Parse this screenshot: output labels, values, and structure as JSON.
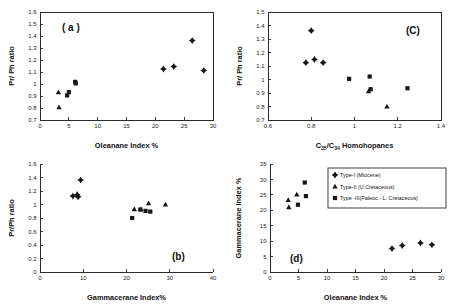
{
  "figure": {
    "background": "#ffffff",
    "marker_color": "#17171a",
    "axis_color": "#2b2b2b"
  },
  "legend": {
    "title": "",
    "entries": [
      {
        "marker": "diamond",
        "label": "Type-I (Miocene)"
      },
      {
        "marker": "triangle",
        "label": "Type-II (U.Cretaceous)"
      },
      {
        "marker": "square",
        "label": "Type -III(Paleoc.- L. Cretaceous)"
      }
    ]
  },
  "chart_data": [
    {
      "id": "panel-a",
      "type": "scatter",
      "title": "( a )",
      "xlabel": "Oleanane Index %",
      "ylabel": "Pr/ Ph ratio",
      "xlim": [
        0,
        30
      ],
      "ylim": [
        0.7,
        1.6
      ],
      "xticks": [
        0,
        5,
        10,
        15,
        20,
        25,
        30
      ],
      "yticks": [
        0.7,
        0.8,
        0.9,
        1.0,
        1.1,
        1.2,
        1.3,
        1.4,
        1.5,
        1.6
      ],
      "ytick_labels": [
        "0.7",
        "0.8",
        "0.9",
        "1",
        "1.1",
        "1.2",
        "1.3",
        "1.4",
        "1.5",
        "1.6"
      ],
      "grid": false,
      "series": [
        {
          "name": "Type-I (Miocene)",
          "marker": "diamond",
          "points": [
            [
              21.4,
              1.125
            ],
            [
              23.2,
              1.145
            ],
            [
              26.4,
              1.362
            ],
            [
              28.4,
              1.113
            ]
          ]
        },
        {
          "name": "Type-II (U.Cretaceous)",
          "marker": "triangle",
          "points": [
            [
              3.2,
              0.93
            ],
            [
              3.3,
              0.805
            ]
          ]
        },
        {
          "name": "Type -III(Paleoc.- L. Cretaceous)",
          "marker": "square",
          "points": [
            [
              4.7,
              0.905
            ],
            [
              5.0,
              0.932
            ],
            [
              6.1,
              1.018
            ],
            [
              6.2,
              1.005
            ]
          ]
        }
      ]
    },
    {
      "id": "panel-c",
      "type": "scatter",
      "title": "(C)",
      "xlabel": "C35/C34 Homohopanes",
      "xlabel_parts": [
        {
          "text": "C",
          "sub": false
        },
        {
          "text": "35",
          "sub": true
        },
        {
          "text": "/C",
          "sub": false
        },
        {
          "text": "34",
          "sub": true
        },
        {
          "text": " Homohopanes",
          "sub": false
        }
      ],
      "ylabel": "Pr/ Ph ratio",
      "xlim": [
        0.6,
        1.4
      ],
      "ylim": [
        0.7,
        1.5
      ],
      "xticks": [
        0.6,
        0.8,
        1.0,
        1.2,
        1.4
      ],
      "xtick_labels": [
        "0.6",
        "0.8",
        "1",
        "1.2",
        "1.4"
      ],
      "yticks": [
        0.7,
        0.8,
        0.9,
        1.0,
        1.1,
        1.2,
        1.3,
        1.4,
        1.5
      ],
      "ytick_labels": [
        "0.7",
        "0.8",
        "0.9",
        "1",
        "1.1",
        "1.2",
        "1.3",
        "1.4",
        "1.5"
      ],
      "grid": false,
      "series": [
        {
          "name": "Type-I (Miocene)",
          "marker": "diamond",
          "points": [
            [
              0.775,
              1.125
            ],
            [
              0.8,
              1.362
            ],
            [
              0.815,
              1.148
            ],
            [
              0.855,
              1.125
            ]
          ]
        },
        {
          "name": "Type-II (U.Cretaceous)",
          "marker": "triangle",
          "points": [
            [
              1.065,
              0.912
            ],
            [
              1.15,
              0.8
            ]
          ]
        },
        {
          "name": "Type -III(Paleoc.- L. Cretaceous)",
          "marker": "square",
          "points": [
            [
              0.975,
              1.005
            ],
            [
              1.07,
              1.022
            ],
            [
              1.075,
              0.928
            ],
            [
              1.245,
              0.935
            ]
          ]
        }
      ]
    },
    {
      "id": "panel-b",
      "type": "scatter",
      "title": "(b)",
      "xlabel": "Gammacerane Index%",
      "ylabel": "Pr/Ph ratio",
      "xlim": [
        0,
        40
      ],
      "ylim": [
        0,
        1.6
      ],
      "xticks": [
        0,
        10,
        20,
        30,
        40
      ],
      "yticks": [
        0,
        0.2,
        0.4,
        0.6,
        0.8,
        1.0,
        1.2,
        1.4,
        1.6
      ],
      "ytick_labels": [
        "0",
        "0.2",
        "0.4",
        "0.6",
        "0.8",
        "1",
        "1.2",
        "1.4",
        "1.6"
      ],
      "grid": false,
      "series": [
        {
          "name": "Type-I (Miocene)",
          "marker": "diamond",
          "points": [
            [
              7.6,
              1.125
            ],
            [
              8.6,
              1.145
            ],
            [
              8.8,
              1.113
            ],
            [
              9.4,
              1.362
            ]
          ]
        },
        {
          "name": "Type-II (U.Cretaceous)",
          "marker": "triangle",
          "points": [
            [
              21.8,
              0.93
            ],
            [
              23.3,
              0.928
            ],
            [
              25.1,
              1.018
            ],
            [
              29.0,
              1.0
            ]
          ]
        },
        {
          "name": "Type -III(Paleoc.- L. Cretaceous)",
          "marker": "square",
          "points": [
            [
              21.3,
              0.8
            ],
            [
              23.2,
              0.925
            ],
            [
              24.4,
              0.905
            ],
            [
              25.5,
              0.895
            ]
          ]
        }
      ]
    },
    {
      "id": "panel-d",
      "type": "scatter",
      "title": "(d)",
      "xlabel": "Oleanane Index %",
      "ylabel": "Gammacerane Index %",
      "xlim": [
        0,
        30
      ],
      "ylim": [
        0,
        35
      ],
      "xticks": [
        0,
        5,
        10,
        15,
        20,
        25,
        30
      ],
      "yticks": [
        0,
        5,
        10,
        15,
        20,
        25,
        30,
        35
      ],
      "grid": false,
      "series": [
        {
          "name": "Type-I (Miocene)",
          "marker": "diamond",
          "points": [
            [
              21.4,
              7.6
            ],
            [
              23.2,
              8.6
            ],
            [
              26.4,
              9.4
            ],
            [
              28.4,
              8.8
            ]
          ]
        },
        {
          "name": "Type-II (U.Cretaceous)",
          "marker": "triangle",
          "points": [
            [
              3.2,
              23.3
            ],
            [
              3.3,
              21.0
            ],
            [
              4.7,
              25.1
            ]
          ]
        },
        {
          "name": "Type -III(Paleoc.- L. Cretaceous)",
          "marker": "square",
          "points": [
            [
              4.9,
              21.8
            ],
            [
              6.1,
              29.0
            ],
            [
              6.3,
              24.6
            ]
          ]
        }
      ]
    }
  ]
}
